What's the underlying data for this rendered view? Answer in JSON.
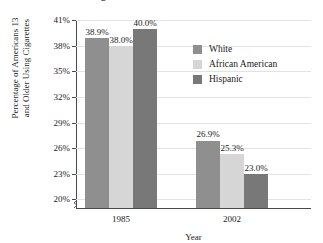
{
  "chart_data": {
    "type": "bar",
    "title": "Cigarette Use in the United States",
    "xlabel": "Year",
    "ylabel_line1": "Percentage of Americans 13",
    "ylabel_line2": "and Older Using Cigarettes",
    "categories": [
      "1985",
      "2002"
    ],
    "series": [
      {
        "name": "White",
        "color": "#8f8f8f",
        "values": [
          38.9,
          26.9
        ],
        "labels": [
          "38.9%",
          "26.9%"
        ]
      },
      {
        "name": "African American",
        "color": "#d6d6d6",
        "values": [
          38.0,
          25.3
        ],
        "labels": [
          "38.0%",
          "25.3%"
        ]
      },
      {
        "name": "Hispanic",
        "color": "#787878",
        "values": [
          40.0,
          23.0
        ],
        "labels": [
          "40.0%",
          "23.0%"
        ]
      }
    ],
    "ylim": [
      19.0,
      41.0
    ],
    "ytick_values": [
      41,
      38,
      35,
      32,
      29,
      26,
      23,
      20
    ],
    "ytick_labels": [
      "41%",
      "38%",
      "35%",
      "32%",
      "29%",
      "26%",
      "23%",
      "20%"
    ],
    "grid": true,
    "axis_break": true,
    "legend_position": "inside-top-right",
    "legend_entries": [
      "White",
      "African American",
      "Hispanic"
    ]
  }
}
